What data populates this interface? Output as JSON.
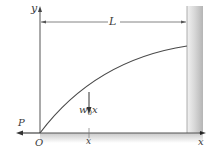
{
  "diagram": {
    "type": "beam-column free body",
    "labels": {
      "y_axis": "y",
      "x_axis": "x",
      "origin": "O",
      "length": "L",
      "axial_load": "P",
      "distributed_load_base": "w",
      "distributed_load_sub": "0",
      "distributed_load_var": "x",
      "position_marker": "x"
    },
    "colors": {
      "line": "#555555",
      "curve": "#4a4a4a",
      "wall_light": "#e6e6e6",
      "wall_dark": "#b9b9b9",
      "ground_shade": "#cfcfcf",
      "text": "#3a3a3a"
    },
    "elements": [
      "y-axis with arrow",
      "x-axis with arrow",
      "fixed wall support at x = L",
      "deflected elastic curve from O to wall",
      "downward load arrow w0x at position x",
      "axial compressive force P at O pointing left",
      "dimension line L between y-axis and wall"
    ]
  }
}
